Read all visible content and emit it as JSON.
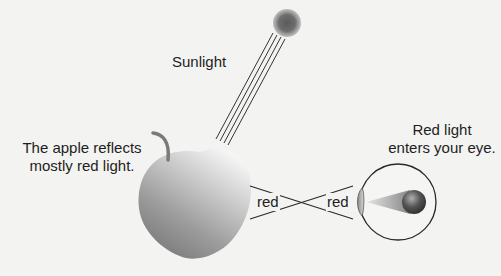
{
  "diagram": {
    "labels": {
      "sunlight": "Sunlight",
      "apple_line1": "The apple reflects",
      "apple_line2": "mostly red light.",
      "eye_line1": "Red light",
      "eye_line2": "enters your eye.",
      "red_left": "red",
      "red_right": "red"
    },
    "elements": [
      {
        "name": "sun",
        "shape": "blurred circle",
        "color": "#6a6a6a"
      },
      {
        "name": "sunlight-rays",
        "shape": "4 parallel diagonal lines",
        "from": "sun",
        "to": "apple"
      },
      {
        "name": "apple",
        "shape": "apple with stem",
        "fill_gradient": [
          "#f2f2f2",
          "#8a8a8a"
        ]
      },
      {
        "name": "reflected-red-rays",
        "shape": "two crossing lines",
        "from": "apple",
        "to": "eye"
      },
      {
        "name": "eye",
        "shape": "circle with lens and retina cone"
      }
    ],
    "colors": {
      "text": "#1e1e1e",
      "lines": "#2a2a2a",
      "background": "#f3f3f1"
    }
  }
}
